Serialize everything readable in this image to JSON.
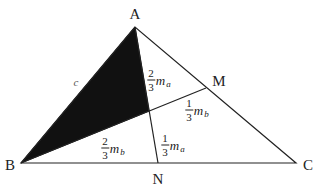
{
  "diagram": {
    "type": "triangle-medians",
    "vertices": {
      "A": {
        "label": "A",
        "x": 135,
        "y": 27,
        "label_x": 135,
        "label_y": 14
      },
      "B": {
        "label": "B",
        "x": 21,
        "y": 163,
        "label_x": 10,
        "label_y": 165
      },
      "C": {
        "label": "C",
        "x": 296,
        "y": 163,
        "label_x": 308,
        "label_y": 165
      },
      "M": {
        "label": "M",
        "x": 206,
        "y": 88,
        "label_x": 219,
        "label_y": 81
      },
      "N": {
        "label": "N",
        "x": 158,
        "y": 163,
        "label_x": 158,
        "label_y": 179
      }
    },
    "centroid": {
      "x": 149,
      "y": 111
    },
    "shaded_region": [
      "A",
      "B",
      "G"
    ],
    "colors": {
      "stroke": "#222222",
      "fill_shaded": "#111111",
      "background": "#ffffff"
    },
    "side_label": {
      "text": "c",
      "x": 76,
      "y": 82
    },
    "segment_labels": [
      {
        "id": "AG",
        "numerator": "2",
        "denominator": "3",
        "var": "m",
        "sub": "a",
        "x": 159,
        "y": 80
      },
      {
        "id": "GM",
        "numerator": "1",
        "denominator": "3",
        "var": "m",
        "sub": "b",
        "x": 197,
        "y": 110
      },
      {
        "id": "BG",
        "numerator": "2",
        "denominator": "3",
        "var": "m",
        "sub": "b",
        "x": 113,
        "y": 148
      },
      {
        "id": "GN",
        "numerator": "1",
        "denominator": "3",
        "var": "m",
        "sub": "a",
        "x": 173,
        "y": 145
      }
    ]
  }
}
